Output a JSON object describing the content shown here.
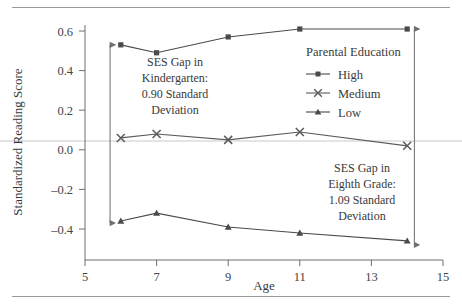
{
  "figure": {
    "clipped_header": "",
    "background": "#ffffff",
    "rule_color": "#9a9a9a"
  },
  "chart_data": {
    "type": "line",
    "title": "",
    "xlabel": "Age",
    "ylabel": "Standardized Reading Score",
    "x": [
      6,
      7,
      9,
      11,
      14
    ],
    "xlim": [
      5,
      15
    ],
    "ylim": [
      -0.5,
      0.68
    ],
    "xticks": [
      5,
      7,
      9,
      11,
      13,
      15
    ],
    "xtick_labels": [
      "5",
      "7",
      "9",
      "11",
      "13",
      "15"
    ],
    "yticks": [
      -0.4,
      -0.2,
      0.0,
      0.2,
      0.4,
      0.6
    ],
    "ytick_labels": [
      "-0.4",
      "-0.2",
      "0.0",
      "0.2",
      "0.4",
      "0.6"
    ],
    "grid": false,
    "zero_reference_line": 0.05,
    "legend_position": "upper-right",
    "legend_title": "Parental Education",
    "series": [
      {
        "name": "High",
        "marker": "square",
        "color": "#4a4a4a",
        "values": [
          0.53,
          0.49,
          0.57,
          0.61,
          0.61
        ]
      },
      {
        "name": "Medium",
        "marker": "cross",
        "color": "#5a5a5a",
        "values": [
          0.06,
          0.08,
          0.05,
          0.09,
          0.02
        ]
      },
      {
        "name": "Low",
        "marker": "triangle",
        "color": "#4a4a4a",
        "values": [
          -0.36,
          -0.32,
          -0.39,
          -0.42,
          -0.46
        ]
      }
    ],
    "annotations": [
      {
        "id": "kindergarten-gap",
        "lines": [
          "SES Gap in",
          "Kindergarten:",
          "0.90 Standard",
          "Deviation"
        ],
        "arrow": {
          "x": 5.7,
          "y_top": 0.53,
          "y_bottom": -0.37
        }
      },
      {
        "id": "eighth-grade-gap",
        "lines": [
          "SES Gap in",
          "Eighth Grade:",
          "1.09 Standard",
          "Deviation"
        ],
        "arrow": {
          "x": 14.2,
          "y_top": 0.61,
          "y_bottom": -0.48
        }
      }
    ]
  }
}
